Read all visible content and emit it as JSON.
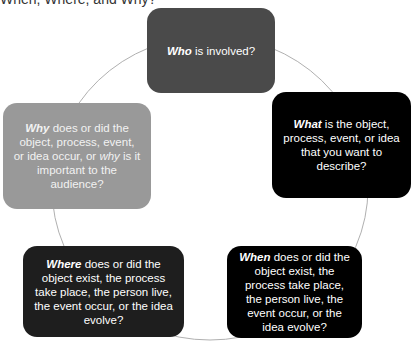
{
  "title": "When, Where, and Why?",
  "colors": {
    "who": "#4a4a4a",
    "what": "#000000",
    "why": "#999999",
    "where": "#1e1e1e",
    "when": "#000000",
    "ring": "#b0b0b0"
  },
  "nodes": {
    "who": {
      "keyword": "Who",
      "text": " is involved?"
    },
    "what": {
      "keyword": "What",
      "text": " is the object, process, event, or idea that you want to describe?"
    },
    "when": {
      "keyword": "When",
      "text": " does or did the object exist, the process take place, the person live, the event occur, or the idea evolve?"
    },
    "where": {
      "keyword": "Where",
      "text": " does or did the object exist, the process take place, the person live, the event occur, or the idea evolve?"
    },
    "why": {
      "keyword": "Why",
      "text": " does or did the object, process, event, or idea occur, or ",
      "keyword2": "why",
      "text2": " is it important to the audience?"
    }
  }
}
